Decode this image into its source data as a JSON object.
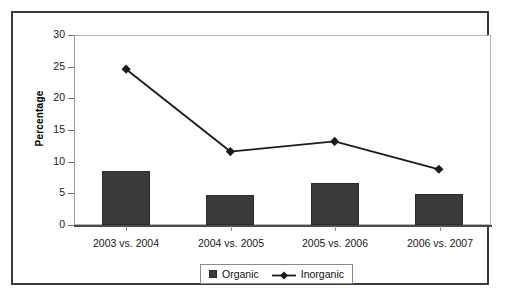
{
  "chart_data": {
    "type": "bar",
    "title": "",
    "subtitle": "",
    "xlabel": "",
    "ylabel": "Percentage",
    "categories": [
      "2003 vs. 2004",
      "2004 vs. 2005",
      "2005 vs. 2006",
      "2006 vs. 2007"
    ],
    "series": [
      {
        "name": "Organic",
        "type": "bar",
        "marker": "square",
        "color": "#3a3a3a",
        "values": [
          8.6,
          4.8,
          6.7,
          4.9
        ]
      },
      {
        "name": "Inorganic",
        "type": "line",
        "marker": "diamond",
        "color": "#1a1a1a",
        "values": [
          24.6,
          11.6,
          13.2,
          8.8
        ]
      }
    ],
    "ylim": [
      0,
      30
    ],
    "yticks": [
      0,
      5,
      10,
      15,
      20,
      25,
      30
    ],
    "ytick_labels": [
      "0",
      "5",
      "10",
      "15",
      "20",
      "25",
      "30"
    ],
    "grid": false,
    "legend_position": "bottom-center",
    "legend_entries": [
      "Organic",
      "Inorganic"
    ]
  }
}
